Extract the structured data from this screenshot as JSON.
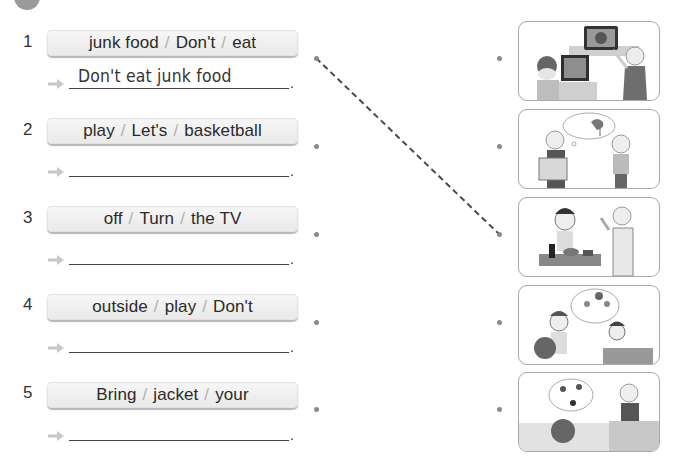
{
  "exercise": {
    "badge_icon": "exercise-number-badge-icon",
    "items": [
      {
        "number": "1",
        "words": [
          "junk food",
          "Don't",
          "eat"
        ],
        "answer": "Don't eat junk food",
        "period": "."
      },
      {
        "number": "2",
        "words": [
          "play",
          "Let's",
          "basketball"
        ],
        "answer": "",
        "period": "."
      },
      {
        "number": "3",
        "words": [
          "off",
          "Turn",
          "the TV"
        ],
        "answer": "",
        "period": "."
      },
      {
        "number": "4",
        "words": [
          "outside",
          "play",
          "Don't"
        ],
        "answer": "",
        "period": "."
      },
      {
        "number": "5",
        "words": [
          "Bring",
          "jacket",
          "your"
        ],
        "answer": "",
        "period": "."
      }
    ],
    "word_separator": "/",
    "arrow_icon": "arrow-right-icon",
    "pictures": [
      {
        "id": 1,
        "description": "Boy at computer, woman pointing at TV"
      },
      {
        "id": 2,
        "description": "Woman holding jacket, thought bubble of windy weather, boy"
      },
      {
        "id": 3,
        "description": "Boy eating junk food, woman in apron gesturing"
      },
      {
        "id": 4,
        "description": "Boy holding basketball, thought bubble of kids playing, boy at desk"
      },
      {
        "id": 5,
        "description": "Child in bed, thought bubble of kids playing soccer, woman"
      }
    ],
    "match_line": {
      "from_item": 1,
      "to_picture": 3,
      "style": "dashed"
    },
    "colors": {
      "box_fill": "#ececec",
      "dot": "#8a8a8a",
      "arrow": "#c8c8c8",
      "line": "#444444",
      "frame_border": "#a8a8a8"
    }
  }
}
